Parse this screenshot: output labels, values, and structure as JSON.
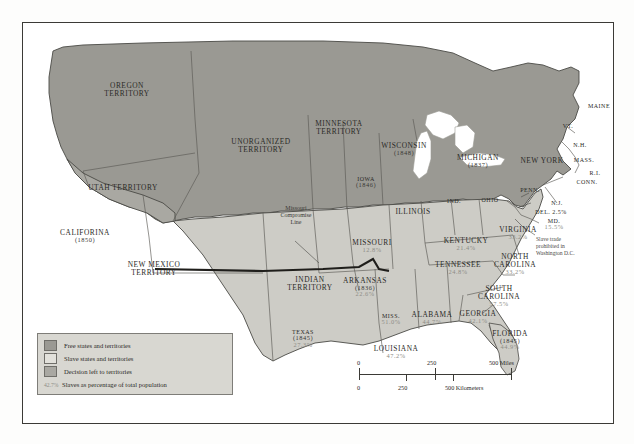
{
  "legend": {
    "items": [
      {
        "swatch": "free",
        "label": "Free states and territories",
        "color": "#9a9993"
      },
      {
        "swatch": "slave",
        "label": "Slave states and territories",
        "color": "#cdccc6"
      },
      {
        "swatch": "decision",
        "label": "Decision left to territories",
        "color": "#a9a8a2"
      }
    ],
    "percent_key": {
      "sample": "42.7%",
      "label": "Slaves as percentage of total population"
    }
  },
  "scale": {
    "miles": {
      "ticks": [
        "0",
        "250",
        "500 Miles"
      ]
    },
    "kilometers": {
      "ticks": [
        "0",
        "250",
        "500 Kilometers"
      ]
    }
  },
  "annotations": {
    "missouri_compromise": "Missouri\nCompromise\nLine",
    "dc_note": "Slave trade\nprohibited in\nWashington D.C."
  },
  "places": [
    {
      "id": "oregon-territory",
      "name": "OREGON\nTERRITORY",
      "year": "",
      "pct": "",
      "x": 104,
      "y": 64,
      "cat": "free"
    },
    {
      "id": "utah-territory",
      "name": "UTAH TERRITORY",
      "year": "",
      "pct": "",
      "x": 100,
      "y": 166,
      "cat": "decision"
    },
    {
      "id": "california",
      "name": "CALIFORINA",
      "year": "(1850)",
      "pct": "",
      "x": 62,
      "y": 211,
      "cat": "free"
    },
    {
      "id": "new-mexico-territory",
      "name": "NEW MEXICO\nTERRITORY",
      "year": "",
      "pct": "",
      "x": 131,
      "y": 243,
      "cat": "decision"
    },
    {
      "id": "unorganized-territory",
      "name": "UNORGANIZED\nTERRITORY",
      "year": "",
      "pct": "",
      "x": 238,
      "y": 120,
      "cat": "free"
    },
    {
      "id": "minnesota-territory",
      "name": "MINNESOTA\nTERRITORY",
      "year": "",
      "pct": "",
      "x": 316,
      "y": 102,
      "cat": "free"
    },
    {
      "id": "wisconsin",
      "name": "WISCONSIN",
      "year": "(1848)",
      "pct": "",
      "x": 381,
      "y": 124,
      "cat": "free"
    },
    {
      "id": "michigan",
      "name": "MICHIGAN",
      "year": "(1837)",
      "pct": "",
      "x": 455,
      "y": 136,
      "cat": "free"
    },
    {
      "id": "iowa",
      "name": "IOWA",
      "year": "(1846)",
      "pct": "",
      "x": 343,
      "y": 158,
      "cat": "free"
    },
    {
      "id": "illinois",
      "name": "ILLINOIS",
      "year": "",
      "pct": "",
      "x": 390,
      "y": 190,
      "cat": "free"
    },
    {
      "id": "indiana",
      "name": "IND.",
      "year": "",
      "pct": "",
      "x": 431,
      "y": 180,
      "cat": "free"
    },
    {
      "id": "ohio",
      "name": "OHIO",
      "year": "",
      "pct": "",
      "x": 467,
      "y": 179,
      "cat": "free"
    },
    {
      "id": "pennsylvania",
      "name": "PENN.",
      "year": "",
      "pct": "",
      "x": 507,
      "y": 169,
      "cat": "free"
    },
    {
      "id": "new-york",
      "name": "NEW YORK",
      "year": "",
      "pct": "",
      "x": 519,
      "y": 139,
      "cat": "free"
    },
    {
      "id": "maine",
      "name": "MAINE",
      "year": "",
      "pct": "",
      "x": 576,
      "y": 85,
      "cat": "free"
    },
    {
      "id": "vermont",
      "name": "VT.",
      "year": "",
      "pct": "",
      "x": 545,
      "y": 105,
      "cat": "free"
    },
    {
      "id": "new-hampshire",
      "name": "N.H.",
      "year": "",
      "pct": "",
      "x": 557,
      "y": 124,
      "cat": "free"
    },
    {
      "id": "massachusetts",
      "name": "MASS.",
      "year": "",
      "pct": "",
      "x": 561,
      "y": 139,
      "cat": "free"
    },
    {
      "id": "rhode-island",
      "name": "R.I.",
      "year": "",
      "pct": "",
      "x": 572,
      "y": 152,
      "cat": "free"
    },
    {
      "id": "connecticut",
      "name": "CONN.",
      "year": "",
      "pct": "",
      "x": 564,
      "y": 161,
      "cat": "free"
    },
    {
      "id": "new-jersey",
      "name": "N.J.",
      "year": "",
      "pct": "",
      "x": 534,
      "y": 182,
      "cat": "free"
    },
    {
      "id": "delaware",
      "name": "DEL.",
      "year": "",
      "pct": "2.5%",
      "x": 528,
      "y": 191,
      "cat": "slave",
      "inline": true
    },
    {
      "id": "maryland",
      "name": "MD.",
      "year": "",
      "pct": "15.5%",
      "x": 531,
      "y": 200,
      "cat": "slave",
      "stacked": true
    },
    {
      "id": "virginia",
      "name": "VIRGINIA",
      "year": "",
      "pct": "33.2%",
      "x": 495,
      "y": 208,
      "cat": "slave"
    },
    {
      "id": "north-carolina",
      "name": "NORTH\nCAROLINA",
      "year": "",
      "pct": "33.2%",
      "x": 492,
      "y": 235,
      "cat": "slave"
    },
    {
      "id": "south-carolina",
      "name": "SOUTH\nCAROLINA",
      "year": "",
      "pct": "57.5%",
      "x": 476,
      "y": 267,
      "cat": "slave"
    },
    {
      "id": "georgia",
      "name": "GEORGIA",
      "year": "",
      "pct": "42.1%",
      "x": 455,
      "y": 292,
      "cat": "slave"
    },
    {
      "id": "florida",
      "name": "FLORIDA",
      "year": "(1845)",
      "pct": "44.9%",
      "x": 487,
      "y": 312,
      "cat": "slave"
    },
    {
      "id": "alabama",
      "name": "ALABAMA",
      "year": "",
      "pct": "44.7%",
      "x": 409,
      "y": 293,
      "cat": "slave"
    },
    {
      "id": "mississippi",
      "name": "MISS.",
      "year": "",
      "pct": "51.0%",
      "x": 368,
      "y": 295,
      "cat": "slave"
    },
    {
      "id": "louisiana",
      "name": "LOUISIANA",
      "year": "",
      "pct": "47.2%",
      "x": 373,
      "y": 327,
      "cat": "slave"
    },
    {
      "id": "tennessee",
      "name": "TENNESSEE",
      "year": "",
      "pct": "24.8%",
      "x": 435,
      "y": 243,
      "cat": "slave"
    },
    {
      "id": "kentucky",
      "name": "KENTUCKY",
      "year": "",
      "pct": "21.4%",
      "x": 443,
      "y": 219,
      "cat": "slave"
    },
    {
      "id": "missouri",
      "name": "MISSOURI",
      "year": "",
      "pct": "12.8%",
      "x": 349,
      "y": 221,
      "cat": "slave"
    },
    {
      "id": "arkansas",
      "name": "ARKANSAS",
      "year": "(1836)",
      "pct": "22.6%",
      "x": 342,
      "y": 259,
      "cat": "slave"
    },
    {
      "id": "indian-territory",
      "name": "INDIAN\nTERRITORY",
      "year": "",
      "pct": "",
      "x": 287,
      "y": 258,
      "cat": "slave"
    },
    {
      "id": "texas",
      "name": "TEXAS",
      "year": "(1845)",
      "pct": "27.3%",
      "x": 280,
      "y": 311,
      "cat": "slave"
    }
  ]
}
